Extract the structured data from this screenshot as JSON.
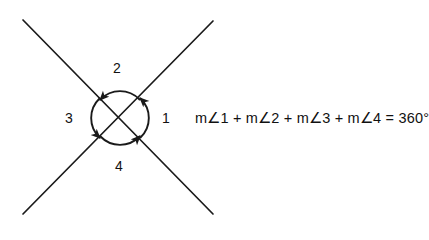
{
  "figure": {
    "background_color": "#ffffff",
    "stroke_color": "#1a1a1a",
    "intersection": {
      "x": 120,
      "y": 118
    },
    "lines": [
      {
        "name": "line-up-right",
        "x1": 23,
        "y1": 214,
        "x2": 213,
        "y2": 21
      },
      {
        "name": "line-down-right",
        "x1": 23,
        "y1": 20,
        "x2": 213,
        "y2": 214
      }
    ],
    "arc_radius": 27,
    "angles": [
      {
        "id": "1",
        "label": "1",
        "position": "right",
        "label_x": 166,
        "label_y": 118,
        "arrow_direction": "counterclockwise"
      },
      {
        "id": "2",
        "label": "2",
        "position": "top",
        "label_x": 117,
        "label_y": 68,
        "arrow_direction": "counterclockwise"
      },
      {
        "id": "3",
        "label": "3",
        "position": "left",
        "label_x": 69,
        "label_y": 118,
        "arrow_direction": "counterclockwise"
      },
      {
        "id": "4",
        "label": "4",
        "position": "bottom",
        "label_x": 119,
        "label_y": 166,
        "arrow_direction": "counterclockwise"
      }
    ]
  },
  "equation": {
    "text": "m∠1 + m∠2 + m∠3 + m∠4 = 360°"
  }
}
